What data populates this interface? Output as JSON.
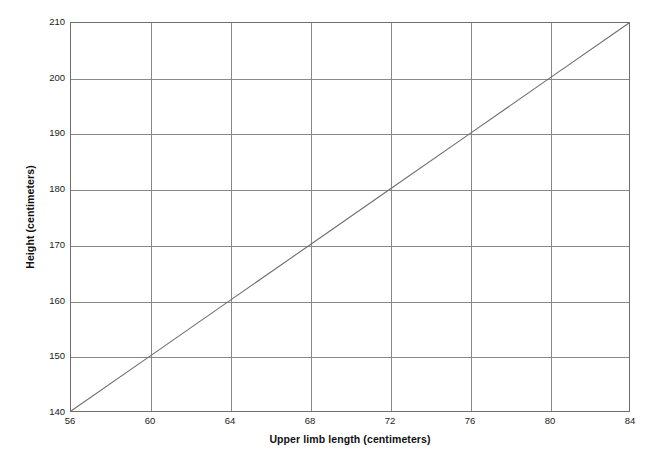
{
  "chart_data": {
    "type": "line",
    "title": "",
    "xlabel": "Upper limb length (centimeters)",
    "ylabel": "Height (centimeters)",
    "xlim": [
      56,
      84
    ],
    "ylim": [
      140,
      210
    ],
    "xticks": [
      56,
      60,
      64,
      68,
      72,
      76,
      80,
      84
    ],
    "yticks": [
      140,
      150,
      160,
      170,
      180,
      190,
      200,
      210
    ],
    "grid": true,
    "legend": "none",
    "series": [
      {
        "name": "height-vs-upper-limb-length",
        "color": "#6e6e6e",
        "x": [
          56,
          60,
          64,
          68,
          72,
          76,
          80,
          84
        ],
        "y": [
          140,
          150,
          160,
          170,
          180,
          190,
          200,
          210
        ]
      }
    ]
  },
  "axes": {
    "x_title": "Upper limb length (centimeters)",
    "y_title": "Height (centimeters)",
    "x_tick_labels": [
      "56",
      "60",
      "64",
      "68",
      "72",
      "76",
      "80",
      "84"
    ],
    "y_tick_labels": [
      "140",
      "150",
      "160",
      "170",
      "180",
      "190",
      "200",
      "210"
    ]
  },
  "colors": {
    "line": "#6e6e6e",
    "grid": "#888888",
    "frame": "#6e6e6e",
    "background": "#ffffff",
    "text": "#1a1a1a"
  }
}
